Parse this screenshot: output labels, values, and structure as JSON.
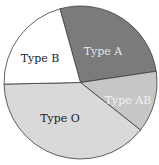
{
  "chart_data": {
    "type": "pie",
    "title": "",
    "categories": [
      "Type A",
      "Type AB",
      "Type O",
      "Type B"
    ],
    "values": [
      27,
      13,
      39,
      21
    ],
    "start_angle_deg": -15.6,
    "direction": "clockwise",
    "colors": [
      "#7b7b7b",
      "#c6c6c6",
      "#d9d9d9",
      "#ffffff"
    ],
    "label_colors": [
      "#e8e8e8",
      "#f2f2f2",
      "#222222",
      "#222222"
    ],
    "legend": "none",
    "labels_inside": true
  },
  "labels": {
    "a": "Type A",
    "ab": "Type AB",
    "o": "Type O",
    "b": "Type B"
  }
}
